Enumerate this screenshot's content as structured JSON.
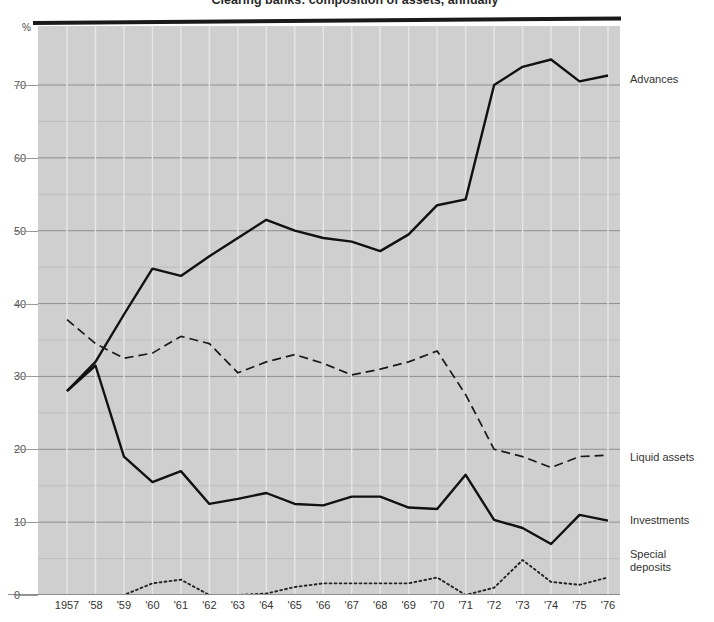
{
  "chart": {
    "title": "Clearing banks: composition of assets, annually",
    "percent_symbol": "%",
    "y_axis": {
      "labels": [
        "0",
        "10",
        "20",
        "30",
        "40",
        "50",
        "60",
        "70"
      ],
      "min": 0,
      "max": 74.5
    },
    "x_axis": {
      "labels": [
        "1957",
        "'58",
        "'59",
        "'60",
        "'61",
        "'62",
        "'63",
        "'64",
        "'65",
        "'66",
        "'67",
        "'68",
        "'69",
        "'70",
        "'71",
        "'72",
        "'73",
        "'74",
        "'75",
        "'76"
      ]
    },
    "series_labels": {
      "advances": "Advances",
      "liquid": "Liquid assets",
      "investments": "Investments",
      "special": "Special\ndeposits"
    }
  },
  "chart_data": {
    "type": "line",
    "title": "Clearing banks: composition of assets, annually",
    "xlabel": "",
    "ylabel": "%",
    "ylim": [
      0,
      74.5
    ],
    "grid": true,
    "legend": "right-of-plot",
    "categories": [
      "1957",
      "'58",
      "'59",
      "'60",
      "'61",
      "'62",
      "'63",
      "'64",
      "'65",
      "'66",
      "'67",
      "'68",
      "'69",
      "'70",
      "'71",
      "'72",
      "'73",
      "'74",
      "'75",
      "'76"
    ],
    "x": [
      1957,
      1958,
      1959,
      1960,
      1961,
      1962,
      1963,
      1964,
      1965,
      1966,
      1967,
      1968,
      1969,
      1970,
      1971,
      1972,
      1973,
      1974,
      1975,
      1976
    ],
    "series": [
      {
        "name": "Advances",
        "style": "solid",
        "color": "#111111",
        "values": [
          28.0,
          32.0,
          38.5,
          44.8,
          43.8,
          46.5,
          49.0,
          51.5,
          50.0,
          49.0,
          48.5,
          47.2,
          49.5,
          53.5,
          54.3,
          70.0,
          72.5,
          73.5,
          70.5,
          71.3
        ]
      },
      {
        "name": "Liquid assets",
        "style": "dashed",
        "color": "#1a1a1a",
        "values": [
          37.8,
          34.5,
          32.5,
          33.2,
          35.5,
          34.5,
          30.5,
          32.0,
          33.0,
          31.8,
          30.2,
          31.0,
          32.0,
          33.5,
          27.5,
          20.0,
          19.0,
          17.5,
          19.0,
          19.2
        ]
      },
      {
        "name": "Investments",
        "style": "solid",
        "color": "#111111",
        "values": [
          28.0,
          31.5,
          19.0,
          15.5,
          17.0,
          12.5,
          13.2,
          14.0,
          12.5,
          12.3,
          13.5,
          13.5,
          12.0,
          11.8,
          16.5,
          10.3,
          9.2,
          7.0,
          11.0,
          10.2
        ]
      },
      {
        "name": "Special deposits",
        "style": "dotted",
        "color": "#222222",
        "values": [
          0.0,
          0.0,
          0.0,
          1.6,
          2.1,
          0.0,
          0.0,
          0.2,
          1.1,
          1.6,
          1.6,
          1.6,
          1.6,
          2.4,
          0.0,
          1.0,
          4.8,
          1.8,
          1.4,
          2.4
        ]
      }
    ]
  }
}
